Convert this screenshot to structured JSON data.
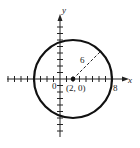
{
  "diagram": {
    "title": "",
    "axes": {
      "x_label": "x",
      "y_label": "y",
      "origin_label": "0"
    },
    "circle": {
      "center": [
        2,
        0
      ],
      "radius": 6,
      "center_label": "(2, 0)",
      "radius_label": "6",
      "x_intercept_label": "8"
    },
    "colors": {
      "stroke": "#111111",
      "background": "#ffffff"
    }
  }
}
